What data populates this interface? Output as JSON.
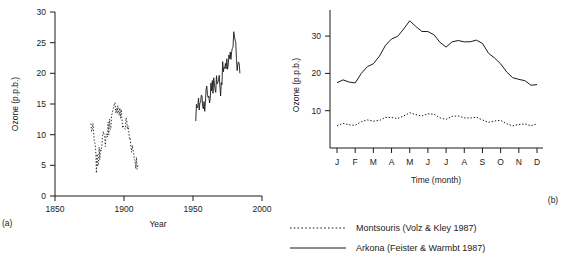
{
  "chart_data": [
    {
      "type": "line",
      "id": "panel-a",
      "panel_tag": "(a)",
      "title": "",
      "xlabel": "Year",
      "ylabel": "Ozone (p.p.b.)",
      "xlim": [
        1850,
        2000
      ],
      "ylim": [
        0,
        30
      ],
      "xticks": [
        1850,
        1900,
        1950,
        2000
      ],
      "yticks": [
        0,
        5,
        10,
        15,
        20,
        25,
        30
      ],
      "grid": false,
      "series": [
        {
          "name": "Montsouris (Volz & Kley 1987)",
          "style": "dotted",
          "x": [
            1876,
            1878,
            1880,
            1882,
            1884,
            1886,
            1888,
            1890,
            1892,
            1894,
            1896,
            1898,
            1900,
            1902,
            1904,
            1906,
            1908,
            1910
          ],
          "y": [
            11.5,
            10.0,
            5.0,
            6.5,
            9.5,
            9.0,
            10.5,
            12.0,
            13.0,
            15.0,
            14.0,
            13.0,
            11.0,
            12.0,
            9.5,
            8.0,
            6.0,
            5.0
          ]
        },
        {
          "name": "Arkona (Feister & Warmbt 1987)",
          "style": "solid",
          "x": [
            1952,
            1954,
            1956,
            1958,
            1960,
            1962,
            1964,
            1966,
            1968,
            1970,
            1972,
            1974,
            1976,
            1978,
            1980,
            1982,
            1984
          ],
          "y": [
            13.5,
            14.5,
            16.0,
            15.0,
            17.0,
            16.0,
            18.5,
            17.5,
            19.5,
            18.0,
            21.0,
            20.0,
            23.0,
            22.0,
            26.5,
            21.0,
            20.0
          ]
        }
      ]
    },
    {
      "type": "line",
      "id": "panel-b",
      "panel_tag": "(b)",
      "title": "",
      "xlabel": "Time (month)",
      "ylabel": "Ozone (p.p.b.)",
      "categories": [
        "J",
        "F",
        "M",
        "A",
        "M",
        "J",
        "J",
        "A",
        "S",
        "O",
        "N",
        "D"
      ],
      "ylim": [
        0,
        37
      ],
      "yticks": [
        10,
        20,
        30
      ],
      "grid": false,
      "series": [
        {
          "name": "Montsouris (Volz & Kley 1987)",
          "style": "dotted",
          "values": [
            6.0,
            6.5,
            7.5,
            8.0,
            9.0,
            9.0,
            8.0,
            8.5,
            7.5,
            7.0,
            6.0,
            6.5
          ]
        },
        {
          "name": "Arkona (Feister & Warmbt 1987)",
          "style": "solid",
          "values": [
            17.5,
            18.0,
            23.0,
            29.0,
            33.5,
            31.0,
            27.5,
            29.0,
            28.0,
            22.0,
            18.0,
            17.0
          ]
        }
      ]
    }
  ],
  "legend": {
    "items": [
      {
        "label": "Montsouris (Volz & Kley 1987)",
        "style": "dotted"
      },
      {
        "label": "Arkona (Feister & Warmbt 1987)",
        "style": "solid"
      }
    ]
  }
}
